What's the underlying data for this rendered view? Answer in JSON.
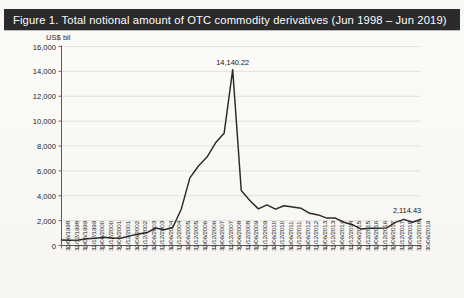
{
  "figure": {
    "title": "Figure 1.  Total notional amount of OTC commodity derivatives (Jun 1998 – Jun 2019)",
    "title_bar_color": "#2b2b2d",
    "title_text_color": "#ffffff"
  },
  "chart_data": {
    "type": "line",
    "title": "Figure 1.  Total notional amount of OTC commodity derivatives (Jun 1998 – Jun 2019)",
    "xlabel": "",
    "ylabel": "US$ bil",
    "ylim": [
      0,
      16000
    ],
    "ytick_step": 2000,
    "yticks": [
      0,
      2000,
      4000,
      6000,
      8000,
      10000,
      12000,
      14000,
      16000
    ],
    "ytick_labels": [
      "0",
      "2,000",
      "4,000",
      "6,000",
      "8,000",
      "10,000",
      "12,000",
      "14,000",
      "16,000"
    ],
    "grid": true,
    "legend": null,
    "line_color": "#2a2a2a",
    "categories": [
      "30/06/1998",
      "31/12/1998",
      "30/06/1999",
      "31/12/1999",
      "30/06/2000",
      "31/12/2000",
      "30/06/2001",
      "31/12/2001",
      "30/06/2002",
      "31/12/2002",
      "30/06/2003",
      "31/12/2003",
      "30/06/2004",
      "31/12/2004",
      "30/06/2005",
      "31/12/2005",
      "30/06/2006",
      "31/12/2006",
      "30/06/2007",
      "31/12/2007",
      "30/06/2008",
      "31/12/2008",
      "30/06/2009",
      "31/12/2009",
      "30/06/2010",
      "31/12/2010",
      "30/06/2011",
      "31/12/2011",
      "30/06/2012",
      "31/12/2012",
      "30/06/2013",
      "31/12/2013",
      "30/06/2014",
      "31/12/2014",
      "30/06/2015",
      "31/12/2015",
      "30/06/2016",
      "31/12/2016",
      "30/06/2017",
      "31/12/2017",
      "30/06/2018",
      "31/12/2018",
      "30/06/2019"
    ],
    "values": [
      443,
      415,
      441,
      548,
      584,
      662,
      590,
      598,
      777,
      923,
      1040,
      1406,
      1270,
      1443,
      2940,
      5435,
      6394,
      7115,
      8255,
      9020,
      14140.22,
      4427,
      3619,
      2944,
      3273,
      2922,
      3197,
      3091,
      2993,
      2587,
      2458,
      2204,
      2206,
      1869,
      1671,
      1320,
      1389,
      1393,
      1417,
      1862,
      2103,
      1868,
      2114.43
    ],
    "annotations": [
      {
        "label": "14,140.22",
        "index": 20,
        "value": 14140.22
      },
      {
        "label": "2,114.43",
        "index": 42,
        "value": 2114.43
      }
    ]
  }
}
